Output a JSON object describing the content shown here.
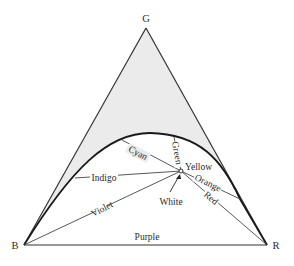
{
  "diagram": {
    "vertices": {
      "green": {
        "label": "G",
        "x": 146,
        "y": 28
      },
      "blue": {
        "label": "B",
        "x": 24,
        "y": 245
      },
      "red": {
        "label": "R",
        "x": 267,
        "y": 245
      }
    },
    "white_point": {
      "label": "White",
      "x": 181,
      "y": 171
    },
    "colors": {
      "line": "#333333",
      "locus": "#1a1a1a",
      "gamut_fill": "#ebebeb",
      "text": "#2a2a2a"
    },
    "spectral_lines": [
      {
        "label": "Cyan"
      },
      {
        "label": "Green"
      },
      {
        "label": "Yellow"
      },
      {
        "label": "Indigo"
      },
      {
        "label": "Violet"
      },
      {
        "label": "Orange"
      },
      {
        "label": "Red"
      }
    ],
    "line_of_purples": {
      "label": "Purple"
    }
  }
}
